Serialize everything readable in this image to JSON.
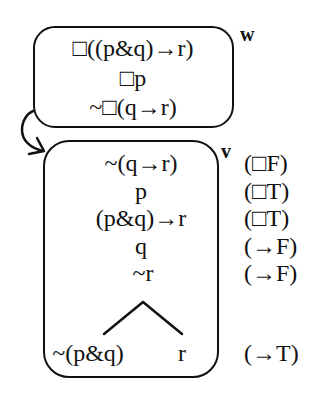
{
  "diagram": {
    "type": "modal-logic-tree",
    "worlds": [
      {
        "name": "w",
        "formulas": [
          "□((p&q)→r)",
          "□p",
          "~□(q→r)"
        ]
      },
      {
        "name": "v",
        "formulas": [
          "~(q→r)",
          "p",
          "(p&q)→r",
          "q",
          "~r"
        ],
        "branches": {
          "left": "~(p&q)",
          "right": "r"
        }
      }
    ],
    "rules": [
      "(□F)",
      "(□T)",
      "(□T)",
      "(→F)",
      "(→F)",
      "(→T)"
    ],
    "accessibility_arrow": {
      "from": "w",
      "to": "v"
    },
    "colors": {
      "ink": "#111111",
      "background": "#ffffff"
    }
  }
}
